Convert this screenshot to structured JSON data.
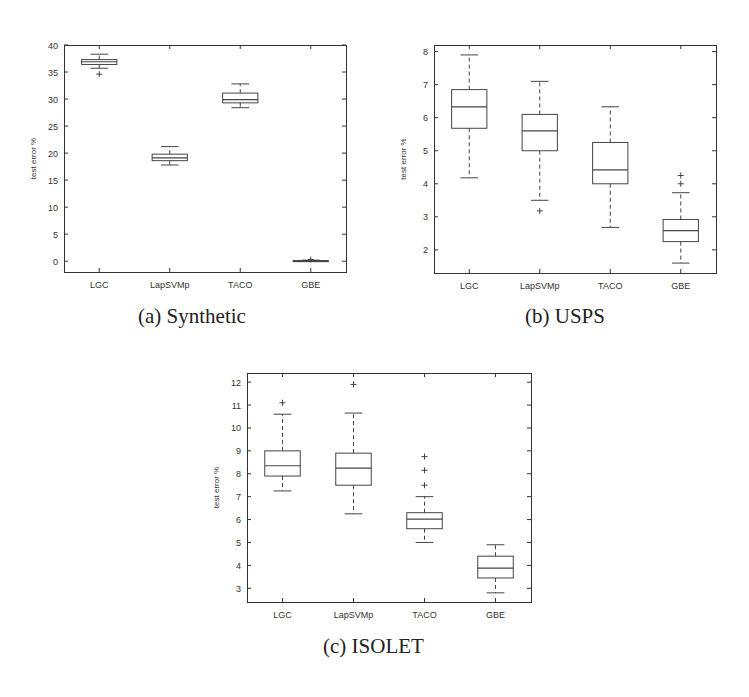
{
  "chart_data": [
    {
      "id": "a",
      "type": "box",
      "caption": "(a) Synthetic",
      "title": "",
      "xlabel": "",
      "ylabel": "test error %",
      "categories": [
        "LGC",
        "LapSVMp",
        "TACO",
        "GBE"
      ],
      "ylim": [
        -2,
        40
      ],
      "yticks": [
        0,
        5,
        10,
        15,
        20,
        25,
        30,
        35,
        40
      ],
      "grid": false,
      "boxes": [
        {
          "name": "LGC",
          "whisker_low": 35.7,
          "q1": 36.4,
          "median": 36.9,
          "q3": 37.3,
          "whisker_high": 38.3,
          "outliers": [
            34.6
          ]
        },
        {
          "name": "LapSVMp",
          "whisker_low": 17.8,
          "q1": 18.6,
          "median": 19.1,
          "q3": 19.8,
          "whisker_high": 21.2,
          "outliers": []
        },
        {
          "name": "TACO",
          "whisker_low": 28.4,
          "q1": 29.3,
          "median": 29.9,
          "q3": 31.1,
          "whisker_high": 32.8,
          "outliers": []
        },
        {
          "name": "GBE",
          "whisker_low": 0.0,
          "q1": 0.0,
          "median": 0.05,
          "q3": 0.1,
          "whisker_high": 0.2,
          "outliers": [
            0.3
          ]
        }
      ]
    },
    {
      "id": "b",
      "type": "box",
      "caption": "(b) USPS",
      "title": "",
      "xlabel": "",
      "ylabel": "test error %",
      "categories": [
        "LGC",
        "LapSVMp",
        "TACO",
        "GBE"
      ],
      "ylim": [
        1.3,
        8.2
      ],
      "yticks": [
        2,
        3,
        4,
        5,
        6,
        7,
        8
      ],
      "grid": false,
      "boxes": [
        {
          "name": "LGC",
          "whisker_low": 4.18,
          "q1": 5.68,
          "median": 6.33,
          "q3": 6.85,
          "whisker_high": 7.9,
          "outliers": []
        },
        {
          "name": "LapSVMp",
          "whisker_low": 3.5,
          "q1": 5.0,
          "median": 5.6,
          "q3": 6.1,
          "whisker_high": 7.1,
          "outliers": [
            3.18
          ]
        },
        {
          "name": "TACO",
          "whisker_low": 2.68,
          "q1": 4.0,
          "median": 4.42,
          "q3": 5.25,
          "whisker_high": 6.33,
          "outliers": []
        },
        {
          "name": "GBE",
          "whisker_low": 1.6,
          "q1": 2.25,
          "median": 2.58,
          "q3": 2.92,
          "whisker_high": 3.73,
          "outliers": [
            4.0,
            4.25
          ]
        }
      ]
    },
    {
      "id": "c",
      "type": "box",
      "caption": "(c) ISOLET",
      "title": "",
      "xlabel": "",
      "ylabel": "test error %",
      "categories": [
        "LGC",
        "LapSVMp",
        "TACO",
        "GBE"
      ],
      "ylim": [
        2.4,
        12.4
      ],
      "yticks": [
        3,
        4,
        5,
        6,
        7,
        8,
        9,
        10,
        11,
        12
      ],
      "grid": false,
      "boxes": [
        {
          "name": "LGC",
          "whisker_low": 7.25,
          "q1": 7.9,
          "median": 8.35,
          "q3": 9.0,
          "whisker_high": 10.6,
          "outliers": [
            11.1
          ]
        },
        {
          "name": "LapSVMp",
          "whisker_low": 6.25,
          "q1": 7.5,
          "median": 8.25,
          "q3": 8.9,
          "whisker_high": 10.65,
          "outliers": [
            11.9
          ]
        },
        {
          "name": "TACO",
          "whisker_low": 5.0,
          "q1": 5.6,
          "median": 6.02,
          "q3": 6.3,
          "whisker_high": 7.0,
          "outliers": [
            7.5,
            8.15,
            8.75
          ]
        },
        {
          "name": "GBE",
          "whisker_low": 2.8,
          "q1": 3.45,
          "median": 3.88,
          "q3": 4.4,
          "whisker_high": 4.9,
          "outliers": []
        }
      ]
    }
  ],
  "layout": {
    "panels": [
      {
        "left": 64,
        "top": 45,
        "width": 282,
        "height": 227,
        "caption_x": 138,
        "caption_y": 318
      },
      {
        "left": 434,
        "top": 45,
        "width": 282,
        "height": 228,
        "caption_x": 525,
        "caption_y": 318
      },
      {
        "left": 247,
        "top": 373,
        "width": 284,
        "height": 229,
        "caption_x": 323,
        "caption_y": 648
      }
    ],
    "colors": {
      "axis": "#333333",
      "box": "#444444",
      "text": "#333333"
    }
  }
}
